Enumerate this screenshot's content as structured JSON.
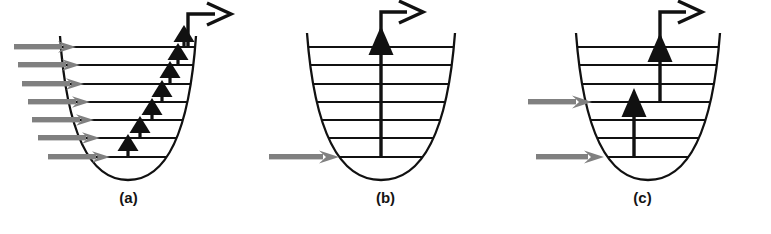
{
  "figure": {
    "background_color": "#ffffff",
    "width": 771,
    "height": 234
  },
  "style": {
    "well_curve_color": "#111111",
    "level_line_color": "#111111",
    "incoming_arrow_color": "#808080",
    "transition_arrow_color": "#111111",
    "escape_arrow_color": "#111111",
    "label_color": "#141414"
  },
  "panels": [
    {
      "id": "a",
      "label": "(a)",
      "mechanism": "sequential ladder climbing",
      "level_count": 7,
      "incoming_arrow_count": 7,
      "transition_arrow_count": 7,
      "transition_span_levels": 1,
      "escape_arrow": "elbow-up-right",
      "incoming_arrows": [
        {
          "level": 7,
          "y": 47
        },
        {
          "level": 6,
          "y": 65
        },
        {
          "level": 5,
          "y": 84
        },
        {
          "level": 4,
          "y": 102
        },
        {
          "level": 3,
          "y": 120
        },
        {
          "level": 2,
          "y": 138
        },
        {
          "level": 1,
          "y": 157
        }
      ],
      "transitions": [
        {
          "from_level": 1,
          "to_level": 2
        },
        {
          "from_level": 2,
          "to_level": 3
        },
        {
          "from_level": 3,
          "to_level": 4
        },
        {
          "from_level": 4,
          "to_level": 5
        },
        {
          "from_level": 5,
          "to_level": 6
        },
        {
          "from_level": 6,
          "to_level": 7
        },
        {
          "from_level": 7,
          "to_level": 8
        }
      ]
    },
    {
      "id": "b",
      "label": "(b)",
      "mechanism": "single quantum direct excitation",
      "level_count": 7,
      "incoming_arrow_count": 1,
      "transition_arrow_count": 1,
      "transition_span_levels": 7,
      "escape_arrow": "elbow-up-right",
      "incoming_arrows": [
        {
          "level": 1,
          "y": 157
        }
      ],
      "transitions": [
        {
          "from_level": 1,
          "to_level": 8
        }
      ]
    },
    {
      "id": "c",
      "label": "(c)",
      "mechanism": "two-step excitation",
      "level_count": 7,
      "incoming_arrow_count": 2,
      "transition_arrow_count": 2,
      "transition_span_levels": 3,
      "escape_arrow": "elbow-up-right",
      "incoming_arrows": [
        {
          "level": 4,
          "y": 102
        },
        {
          "level": 1,
          "y": 157
        }
      ],
      "transitions": [
        {
          "from_level": 1,
          "to_level": 4
        },
        {
          "from_level": 4,
          "to_level": 8
        }
      ]
    }
  ]
}
